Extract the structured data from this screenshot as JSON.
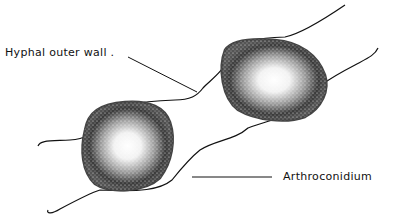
{
  "figure": {
    "type": "botanical line drawing",
    "colors": {
      "ink": "#111111",
      "stipple": "#222222",
      "background": "#ffffff"
    }
  },
  "labels": {
    "hyphal_outer_wall": "Hyphal outer wall .",
    "arthroconidium": "Arthroconidium"
  }
}
